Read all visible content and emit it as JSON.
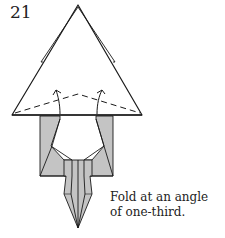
{
  "step": {
    "number": "21"
  },
  "caption": {
    "line1": "Fold at an angle",
    "line2": "of one-third."
  },
  "colors": {
    "paper_front": "#ffffff",
    "paper_back": "#c4c4c4",
    "line": "#1a1a1a"
  },
  "diagram": {
    "icons": [
      "triangle-body",
      "valley-fold-dashed-line",
      "fold-arrow-left",
      "fold-arrow-right",
      "gray-legs",
      "central-spike"
    ]
  }
}
